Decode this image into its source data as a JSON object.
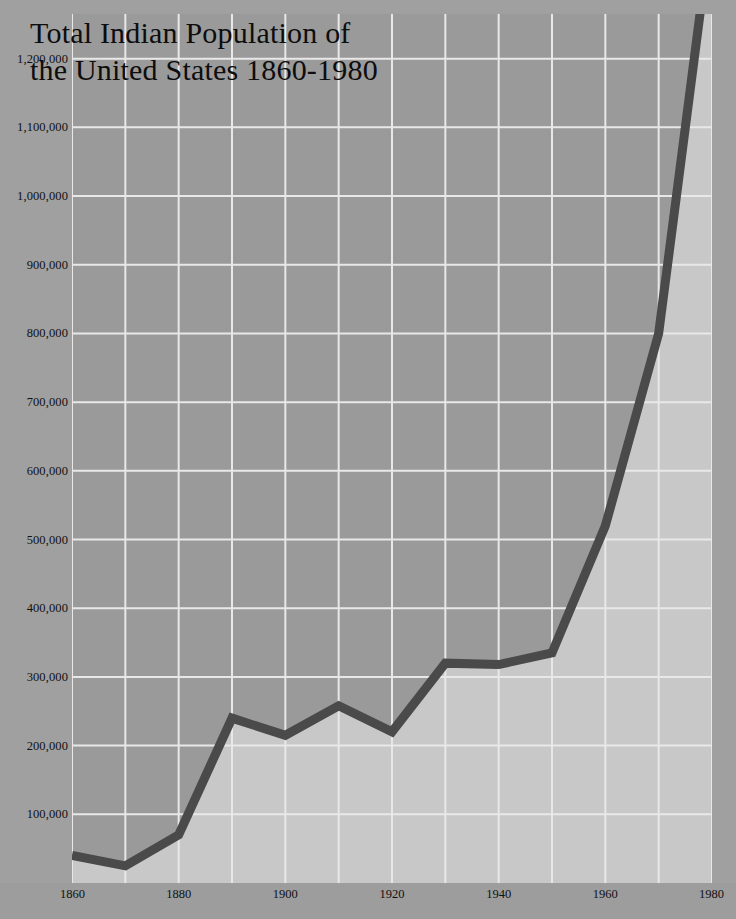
{
  "chart_data": {
    "type": "line",
    "title": "Total Indian Population of\nthe United States 1860-1980",
    "xlabel": "",
    "ylabel": "",
    "x": [
      1860,
      1870,
      1880,
      1890,
      1900,
      1910,
      1920,
      1930,
      1940,
      1950,
      1960,
      1970,
      1980
    ],
    "values": [
      40000,
      25000,
      70000,
      240000,
      215000,
      258000,
      220000,
      320000,
      318000,
      335000,
      520000,
      800000,
      1400000
    ],
    "xtick_labels": [
      "1860",
      "1880",
      "1900",
      "1920",
      "1940",
      "1960",
      "1980"
    ],
    "xticks": [
      1860,
      1880,
      1900,
      1920,
      1940,
      1960,
      1980
    ],
    "xlim": [
      1860,
      1980
    ],
    "ylim": [
      0,
      1265000
    ],
    "yticks": [
      100000,
      200000,
      300000,
      400000,
      500000,
      600000,
      700000,
      800000,
      900000,
      1000000,
      1100000,
      1200000
    ],
    "ytick_labels": [
      "100,000",
      "200,000",
      "300,000",
      "400,000",
      "500,000",
      "600,000",
      "700,000",
      "800,000",
      "900,000",
      "1,000,000",
      "1,100,000",
      "1,200,000"
    ],
    "minor_x_gridlines": [
      1870,
      1890,
      1910,
      1930,
      1950,
      1970
    ],
    "grid": true,
    "legend": null,
    "series": [
      {
        "name": "Total Indian Population",
        "color": "#4a4a4a",
        "line_width": 9,
        "values": [
          40000,
          25000,
          70000,
          240000,
          215000,
          258000,
          220000,
          320000,
          318000,
          335000,
          520000,
          800000,
          1400000
        ]
      }
    ],
    "colors": {
      "background": "#a3a3a3",
      "fill_left": "#9a9a9a",
      "fill_right": "#c8c8c8",
      "gridline": "#e8e8e8",
      "line": "#4a4a4a",
      "text": "#111111"
    }
  }
}
